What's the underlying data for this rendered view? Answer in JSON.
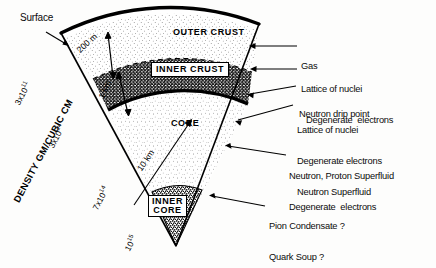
{
  "figure": {
    "type": "cross-section-diagram",
    "background_color": "#fdfdfc",
    "ink_color": "#000000"
  },
  "axis": {
    "title": "DENSITY GM/CUBIC CM",
    "ticks": [
      {
        "mantissa": "3x10",
        "exponent": "11",
        "full": "3x10^11"
      },
      {
        "mantissa": "3x10",
        "exponent": "14",
        "full": "3x10^14"
      },
      {
        "mantissa": "7x10",
        "exponent": "14",
        "full": "7x10^14"
      },
      {
        "mantissa": "10",
        "exponent": "15",
        "full": "10^15"
      }
    ]
  },
  "regions": [
    {
      "id": "outer-crust",
      "label": "OUTER CRUST",
      "boxed": false
    },
    {
      "id": "inner-crust",
      "label": "INNER CRUST",
      "boxed": true
    },
    {
      "id": "core",
      "label": "CORE",
      "boxed": false
    },
    {
      "id": "inner-core",
      "label_line1": "INNER",
      "label_line2": "CORE",
      "boxed": true
    }
  ],
  "dimensions": [
    {
      "id": "outer-crust-thickness",
      "label": "200 m"
    },
    {
      "id": "inner-crust-thickness",
      "label": "1 km"
    },
    {
      "id": "core-radius",
      "label": "10 km"
    }
  ],
  "left_labels": [
    {
      "id": "surface",
      "label": "Surface"
    }
  ],
  "callouts": [
    {
      "id": "gas",
      "lines": [
        "Gas"
      ]
    },
    {
      "id": "outer-crust-composition",
      "lines": [
        "Lattice of nuclei",
        "Degenerate  electrons"
      ]
    },
    {
      "id": "neutron-drip-point",
      "lines": [
        "Neutron drip point"
      ]
    },
    {
      "id": "inner-crust-composition",
      "lines": [
        "Lattice of nuclei",
        "Degenerate electrons",
        "Neutron Superfluid"
      ]
    },
    {
      "id": "core-composition",
      "lines": [
        "Neutron, Proton Superfluid",
        "Degenerate  electrons"
      ]
    },
    {
      "id": "inner-core-composition",
      "lines": [
        "Pion Condensate ?",
        "Quark Soup ?"
      ]
    }
  ]
}
